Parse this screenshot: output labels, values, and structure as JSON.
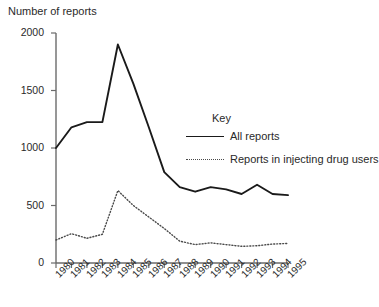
{
  "chart_data": {
    "type": "line",
    "title": "Number of reports",
    "xlabel": "",
    "ylabel": "Number of reports",
    "ylim": [
      0,
      2000
    ],
    "yticks": [
      0,
      500,
      1000,
      1500,
      2000
    ],
    "grid": false,
    "legend_position": "inside-right",
    "legend_title": "Key",
    "categories": [
      "1980",
      "1981",
      "1982",
      "1983",
      "1984",
      "1985",
      "1986",
      "1987",
      "1988",
      "1989",
      "1990",
      "1991",
      "1992",
      "1993",
      "1994",
      "1995"
    ],
    "series": [
      {
        "name": "All reports",
        "style": "solid",
        "color": "#1a1a1a",
        "values": [
          1000,
          1180,
          1225,
          1225,
          1900,
          1560,
          1180,
          790,
          660,
          620,
          660,
          640,
          600,
          680,
          600,
          590
        ]
      },
      {
        "name": "Reports in injecting drug users",
        "style": "dotted",
        "color": "#4a4a4a",
        "values": [
          200,
          255,
          215,
          250,
          630,
          500,
          400,
          300,
          190,
          160,
          175,
          160,
          145,
          150,
          165,
          170
        ]
      }
    ]
  },
  "axis": {
    "y_title": "Number of reports",
    "y_tick_labels": [
      "2000",
      "1500",
      "1000",
      "500",
      "0"
    ],
    "x_tick_labels": [
      "1980",
      "1981",
      "1982",
      "1983",
      "1984",
      "1985",
      "1986",
      "1987",
      "1988",
      "1989",
      "1990",
      "1991",
      "1992",
      "1993",
      "1994",
      "1995"
    ]
  },
  "legend": {
    "title": "Key",
    "entries": [
      {
        "label": "All reports",
        "style": "solid"
      },
      {
        "label": "Reports in injecting drug users",
        "style": "dotted"
      }
    ]
  }
}
